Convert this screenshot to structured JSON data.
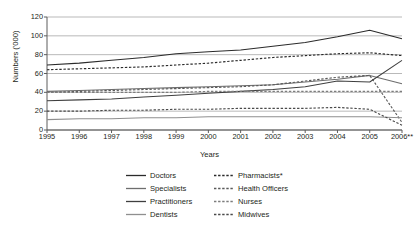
{
  "axes": {
    "ylabel": "Numbers ('000)",
    "xlabel": "Years",
    "yticks": [
      "0",
      "20",
      "40",
      "60",
      "80",
      "100",
      "120"
    ],
    "xticks": [
      "1995",
      "1996",
      "1997",
      "1998",
      "1999",
      "2000",
      "2001",
      "2002",
      "2003",
      "2004",
      "2005",
      "2006**"
    ]
  },
  "legend": {
    "items": [
      {
        "label": "Doctors",
        "style": "solid",
        "color": "#2b2b2b"
      },
      {
        "label": "Pharmacists*",
        "style": "dashed",
        "color": "#2b2b2b"
      },
      {
        "label": "Specialists",
        "style": "solid",
        "color": "#6e6e6e"
      },
      {
        "label": "Health Officers",
        "style": "dashed",
        "color": "#5a5a5a"
      },
      {
        "label": "Practitioners",
        "style": "solid",
        "color": "#3f3f3f"
      },
      {
        "label": "Nurses",
        "style": "dashed",
        "color": "#7d7d7d"
      },
      {
        "label": "Dentists",
        "style": "solid",
        "color": "#8f8f8f"
      },
      {
        "label": "Midwives",
        "style": "dashed",
        "color": "#4a4a4a"
      }
    ]
  },
  "chart_data": {
    "type": "line",
    "title": "",
    "xlabel": "Years",
    "ylabel": "Numbers ('000)",
    "x": [
      1995,
      1996,
      1997,
      1998,
      1999,
      2000,
      2001,
      2002,
      2003,
      2004,
      2005,
      2006
    ],
    "xtick_labels": [
      "1995",
      "1996",
      "1997",
      "1998",
      "1999",
      "2000",
      "2001",
      "2002",
      "2003",
      "2004",
      "2005",
      "2006**"
    ],
    "ylim": [
      0,
      120
    ],
    "ytick_step": 20,
    "grid": "horizontal",
    "legend_position": "bottom",
    "series": [
      {
        "name": "Doctors",
        "style": "solid",
        "color": "#2b2b2b",
        "values": [
          69,
          71,
          74,
          77,
          81,
          83,
          85,
          89,
          93,
          99,
          106,
          97
        ]
      },
      {
        "name": "Pharmacists*",
        "style": "dashed",
        "color": "#2b2b2b",
        "values": [
          64,
          65,
          66,
          67,
          69,
          71,
          74,
          77,
          79,
          81,
          82,
          79
        ]
      },
      {
        "name": "Specialists",
        "style": "solid",
        "color": "#6e6e6e",
        "values": [
          41,
          42,
          43,
          44,
          45,
          46,
          47,
          48,
          51,
          54,
          58,
          49
        ]
      },
      {
        "name": "Health Officers",
        "style": "dashed",
        "color": "#5a5a5a",
        "values": [
          40,
          41,
          42,
          43,
          44,
          45,
          46,
          48,
          52,
          56,
          58,
          8
        ]
      },
      {
        "name": "Practitioners",
        "style": "solid",
        "color": "#3f3f3f",
        "values": [
          31,
          32,
          33,
          35,
          37,
          39,
          41,
          43,
          46,
          52,
          51,
          74
        ]
      },
      {
        "name": "Nurses",
        "style": "dashed",
        "color": "#7d7d7d",
        "values": [
          40,
          40,
          40,
          40,
          40,
          41,
          41,
          41,
          41,
          41,
          41,
          41
        ]
      },
      {
        "name": "Dentists",
        "style": "solid",
        "color": "#8f8f8f",
        "values": [
          11,
          12,
          12,
          13,
          13,
          14,
          14,
          14,
          14,
          14,
          14,
          13
        ]
      },
      {
        "name": "Midwives",
        "style": "dashed",
        "color": "#4a4a4a",
        "values": [
          20,
          20,
          21,
          21,
          22,
          22,
          23,
          23,
          23,
          24,
          22,
          5
        ]
      }
    ]
  }
}
